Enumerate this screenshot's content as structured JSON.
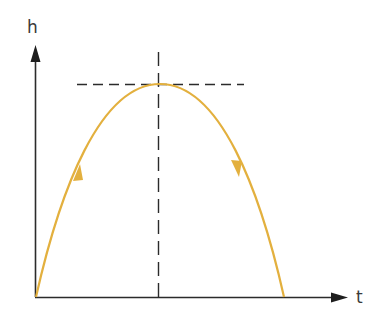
{
  "diagram": {
    "title": "",
    "type": "height-time trajectory",
    "axes": {
      "y_label": "h",
      "x_label": "t"
    },
    "curve": {
      "shape": "parabola",
      "color": "#e3b03e",
      "start": [
        36,
        297
      ],
      "peak": [
        160,
        84
      ],
      "end": [
        284,
        297
      ],
      "arrows": [
        "up-along-rising-branch",
        "down-along-falling-branch"
      ]
    },
    "guides": {
      "horizontal_dashed_at_peak": true,
      "vertical_dashed_at_peak": true,
      "color": "#2b2b2b"
    },
    "colors": {
      "axis": "#2b2b2b",
      "curve": "#e3b03e",
      "background": "#ffffff"
    }
  }
}
